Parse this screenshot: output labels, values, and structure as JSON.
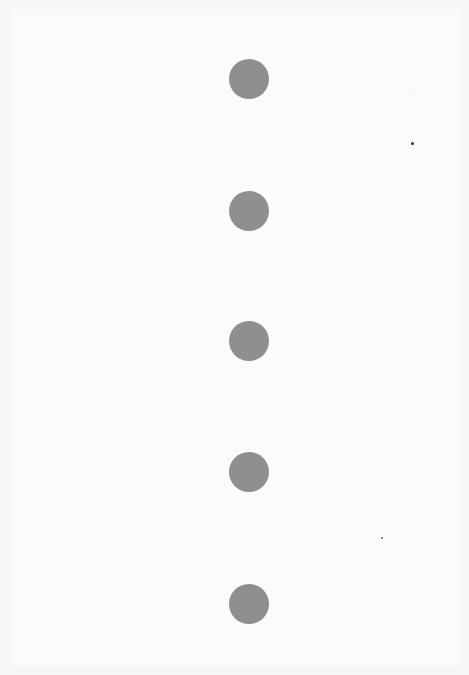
{
  "page": {
    "background": "#fbfbfb",
    "edge": "#f6f6f6"
  },
  "dots": [
    {
      "cx": 249,
      "cy": 79,
      "d": 40,
      "color": "#8f8f8f"
    },
    {
      "cx": 249,
      "cy": 211,
      "d": 40,
      "color": "#8f8f8f"
    },
    {
      "cx": 249,
      "cy": 341,
      "d": 40,
      "color": "#8f8f8f"
    },
    {
      "cx": 249,
      "cy": 472,
      "d": 40,
      "color": "#8f8f8f"
    },
    {
      "cx": 249,
      "cy": 604,
      "d": 40,
      "color": "#8f8f8f"
    }
  ],
  "specks": [
    {
      "x": 411,
      "y": 142,
      "d": 3,
      "color": "#333333"
    },
    {
      "x": 381,
      "y": 537,
      "d": 2,
      "color": "#666666"
    },
    {
      "x": 411,
      "y": 89,
      "d": 1,
      "color": "#cccccc"
    }
  ]
}
